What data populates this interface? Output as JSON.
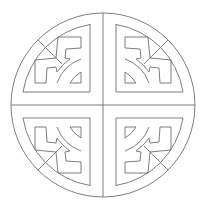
{
  "figure": {
    "title": "Circular fret roundel motif",
    "colors": {
      "background": "#ffffff",
      "stroke": "#6e6e6e"
    },
    "geometry": {
      "center_x": 103,
      "center_y": 105,
      "outer_radius": 92
    },
    "quadrants": [
      {
        "name": "top-left",
        "rotation": 0
      },
      {
        "name": "top-right",
        "rotation": 90
      },
      {
        "name": "bottom-right",
        "rotation": 180
      },
      {
        "name": "bottom-left",
        "rotation": 270
      }
    ]
  }
}
